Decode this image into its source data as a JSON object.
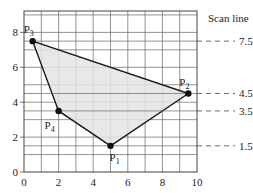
{
  "diagram": {
    "title": "Scan line",
    "axes": {
      "x_ticks": [
        "0",
        "2",
        "4",
        "6",
        "8",
        "10"
      ],
      "y_ticks": [
        "0",
        "2",
        "4",
        "6",
        "8"
      ],
      "x_range": [
        0,
        10
      ],
      "y_range": [
        0,
        9.2
      ]
    },
    "polygon": {
      "fill": "#e4e4e4",
      "stroke": "#1a1a1a",
      "vertices": [
        {
          "name": "P1",
          "label_main": "P",
          "label_sub": "1",
          "x": 5,
          "y": 1.5
        },
        {
          "name": "P2",
          "label_main": "P",
          "label_sub": "2",
          "x": 9.5,
          "y": 4.5
        },
        {
          "name": "P3",
          "label_main": "P",
          "label_sub": "3",
          "x": 0.5,
          "y": 7.5
        },
        {
          "name": "P4",
          "label_main": "P",
          "label_sub": "4",
          "x": 2,
          "y": 3.5
        }
      ]
    },
    "scan_lines": [
      {
        "y": 7.5,
        "label": "7.5"
      },
      {
        "y": 4.5,
        "label": "4.5"
      },
      {
        "y": 3.5,
        "label": "3.5"
      },
      {
        "y": 1.5,
        "label": "1.5"
      }
    ],
    "grid_color": "#555555"
  }
}
